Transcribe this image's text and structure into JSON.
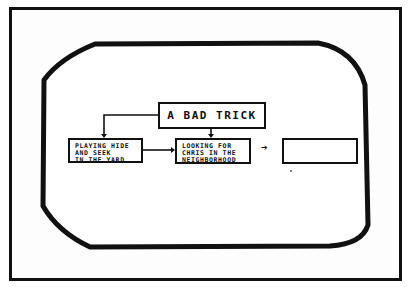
{
  "diagram": {
    "title": "A BAD TRICK",
    "nodes": [
      {
        "id": "playing",
        "lines": "PLAYING HIDE\nAND SEEK\nIN THE YARD"
      },
      {
        "id": "looking",
        "lines": "LOOKING FOR\nCHRIS IN THE\nNEIGHBORHOOD"
      },
      {
        "id": "empty",
        "lines": ""
      }
    ],
    "arrow_glyph": "➔",
    "edges": [
      {
        "from": "title",
        "to": "playing"
      },
      {
        "from": "title",
        "to": "looking"
      },
      {
        "from": "playing",
        "to": "looking"
      },
      {
        "from": "looking",
        "to": "empty"
      }
    ]
  }
}
